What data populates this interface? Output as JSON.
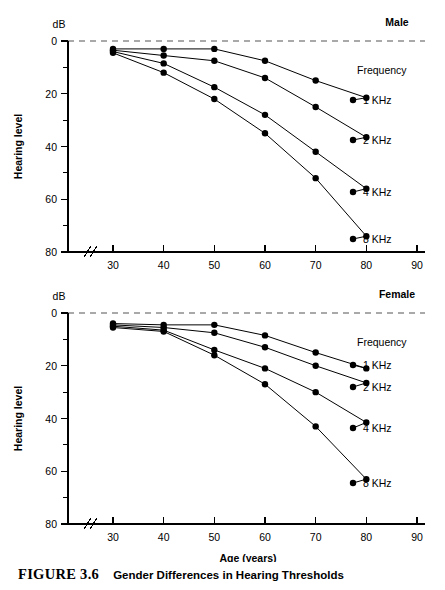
{
  "figure": {
    "caption_id": "FIGURE 3.6",
    "caption_text": "Gender Differences in Hearing Thresholds"
  },
  "chart_data": [
    {
      "type": "line",
      "title": "Male",
      "xlabel": "Age (years)",
      "ylabel": "Hearing level",
      "yunit": "dB",
      "legend_title": "Frequency",
      "legend_position": "right",
      "grid": false,
      "axis_break_x": true,
      "reference_line_y": 0,
      "x": [
        30,
        40,
        50,
        60,
        70,
        80
      ],
      "xticks": [
        30,
        40,
        50,
        60,
        70,
        80,
        90
      ],
      "xlim": [
        25,
        90
      ],
      "yticks": [
        0,
        20,
        40,
        60,
        80
      ],
      "yminor": [
        10,
        30,
        50,
        70
      ],
      "ylim": [
        0,
        80
      ],
      "y_inverted": true,
      "series": [
        {
          "name": "1 KHz",
          "values": [
            3.0,
            3.0,
            3.0,
            7.5,
            15.0,
            21.5
          ]
        },
        {
          "name": "2 KHz",
          "values": [
            3.5,
            5.5,
            7.5,
            14.0,
            25.0,
            36.5
          ]
        },
        {
          "name": "4 KHz",
          "values": [
            4.0,
            8.5,
            17.5,
            28.0,
            42.0,
            56.0
          ]
        },
        {
          "name": "8 KHz",
          "values": [
            4.5,
            12.0,
            22.0,
            35.0,
            52.0,
            74.0
          ]
        }
      ]
    },
    {
      "type": "line",
      "title": "Female",
      "xlabel": "Age (years)",
      "ylabel": "Hearing level",
      "yunit": "dB",
      "legend_title": "Frequency",
      "legend_position": "right",
      "grid": false,
      "axis_break_x": true,
      "reference_line_y": 0,
      "x": [
        30,
        40,
        50,
        60,
        70,
        80
      ],
      "xticks": [
        30,
        40,
        50,
        60,
        70,
        80,
        90
      ],
      "xlim": [
        25,
        90
      ],
      "yticks": [
        0,
        20,
        40,
        60,
        80
      ],
      "yminor": [
        10,
        30,
        50,
        70
      ],
      "ylim": [
        0,
        80
      ],
      "y_inverted": true,
      "series": [
        {
          "name": "1 KHz",
          "values": [
            4.0,
            4.5,
            4.5,
            8.5,
            15.0,
            21.0
          ]
        },
        {
          "name": "2 KHz",
          "values": [
            4.5,
            5.5,
            7.5,
            13.0,
            20.0,
            26.5
          ]
        },
        {
          "name": "4 KHz",
          "values": [
            5.0,
            6.5,
            14.0,
            21.0,
            30.0,
            41.5
          ]
        },
        {
          "name": "8 KHz",
          "values": [
            5.5,
            7.0,
            16.0,
            27.0,
            43.0,
            63.0
          ]
        }
      ]
    }
  ]
}
